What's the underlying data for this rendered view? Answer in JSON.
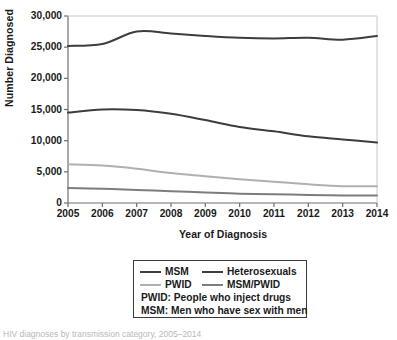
{
  "chart_data": {
    "type": "line",
    "title": "",
    "subtitle": "",
    "xlabel": "Year of Diagnosis",
    "ylabel": "Number Diagnosed",
    "x": [
      2005,
      2006,
      2007,
      2008,
      2009,
      2010,
      2011,
      2012,
      2013,
      2014
    ],
    "categories": [
      "2005",
      "2006",
      "2007",
      "2008",
      "2009",
      "2010",
      "2011",
      "2012",
      "2013",
      "2014"
    ],
    "xlim": [
      2005,
      2014
    ],
    "ylim": [
      0,
      30000
    ],
    "yticks": [
      0,
      5000,
      10000,
      15000,
      20000,
      25000,
      30000
    ],
    "ytick_labels": [
      "0",
      "5,000",
      "10,000",
      "15,000",
      "20,000",
      "25,000",
      "30,000"
    ],
    "xticks": [
      2005,
      2006,
      2007,
      2008,
      2009,
      2010,
      2011,
      2012,
      2013,
      2014
    ],
    "xtick_labels": [
      "2005",
      "2006",
      "2007",
      "2008",
      "2009",
      "2010",
      "2011",
      "2012",
      "2013",
      "2014"
    ],
    "grid": false,
    "legend_position": "below-center",
    "series": [
      {
        "name": "MSM",
        "color": "#3d3d3d",
        "values": [
          25200,
          25500,
          27500,
          27200,
          26800,
          26500,
          26400,
          26500,
          26200,
          26800
        ]
      },
      {
        "name": "Heterosexuals",
        "color": "#3d3d3d",
        "values": [
          14500,
          15000,
          14900,
          14300,
          13300,
          12200,
          11500,
          10700,
          10200,
          9700
        ]
      },
      {
        "name": "PWID",
        "color": "#b0b0b0",
        "values": [
          6200,
          6000,
          5500,
          4800,
          4300,
          3800,
          3400,
          3000,
          2700,
          2700
        ]
      },
      {
        "name": "MSM/PWID",
        "color": "#7d7d7d",
        "values": [
          2400,
          2300,
          2100,
          1900,
          1700,
          1500,
          1400,
          1300,
          1200,
          1200
        ]
      }
    ],
    "annotations": [
      "PWID: People who inject drugs",
      "MSM: Men who have sex with men"
    ]
  },
  "legend": {
    "entries": [
      {
        "label": "MSM",
        "color": "#3d3d3d"
      },
      {
        "label": "Heterosexuals",
        "color": "#3d3d3d"
      },
      {
        "label": "PWID",
        "color": "#b0b0b0"
      },
      {
        "label": "MSM/PWID",
        "color": "#7d7d7d"
      }
    ],
    "notes": [
      "PWID: People who inject drugs",
      "MSM: Men who have sex with men"
    ]
  },
  "footer": {
    "caption": "HIV diagnoses by transmission category, 2005–2014"
  },
  "colors": {
    "axis": "#6e6e6e",
    "text": "#1a1a1a",
    "background": "#ffffff",
    "dark_line": "#3d3d3d",
    "mid_line": "#7d7d7d",
    "light_line": "#b0b0b0"
  }
}
